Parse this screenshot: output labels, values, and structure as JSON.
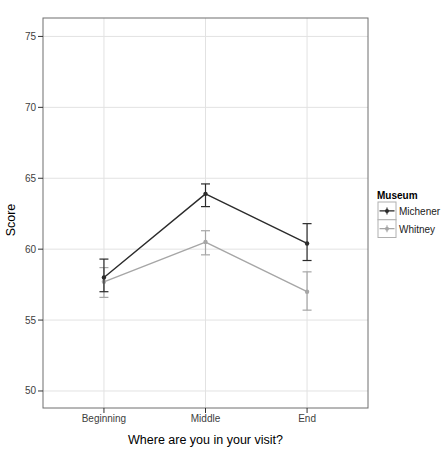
{
  "chart_data": {
    "type": "line",
    "title": "",
    "xlabel": "Where are you in your visit?",
    "ylabel": "Score",
    "categories": [
      "Beginning",
      "Middle",
      "End"
    ],
    "series": [
      {
        "name": "Michener",
        "color": "#2b2b2b",
        "values": [
          58.0,
          63.9,
          60.4
        ],
        "ci_lower": [
          57.0,
          63.0,
          59.2
        ],
        "ci_upper": [
          59.3,
          64.6,
          61.8
        ]
      },
      {
        "name": "Whitney",
        "color": "#a6a6a6",
        "values": [
          57.7,
          60.5,
          57.0
        ],
        "ci_lower": [
          56.6,
          59.6,
          55.7
        ],
        "ci_upper": [
          58.7,
          61.3,
          58.4
        ]
      }
    ],
    "y_ticks": [
      50,
      55,
      60,
      65,
      70,
      75
    ],
    "ylim": [
      48.8,
      76.3
    ],
    "grid": true,
    "error_bars": true,
    "legend": {
      "title": "Museum",
      "position": "right"
    }
  },
  "colors": {
    "background": "#ffffff",
    "grid": "#e2e2e2",
    "panel_border": "#6e6e6e",
    "tick_mark": "#333333",
    "legend_key_border": "#b0b0b0",
    "legend_key_fill": "#ffffff"
  }
}
